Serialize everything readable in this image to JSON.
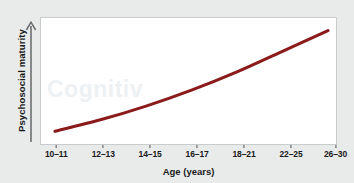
{
  "figure": {
    "background_color": "#e9ebeb",
    "plot_background_color": "#ffffff",
    "plot_border_color": "#c9cccd",
    "watermark_text": "Cognitiv"
  },
  "axes": {
    "y_arrow_icon": "up-arrow-icon",
    "y_axis_label": "Psychosocial maturity",
    "x_axis_label": "Age (years)"
  },
  "chart_data": {
    "type": "line",
    "title": "",
    "subtitle": "",
    "xlabel": "Age (years)",
    "ylabel": "Psychosocial maturity",
    "categories": [
      "10–11",
      "12–13",
      "14–15",
      "16–17",
      "18–21",
      "22–25",
      "26–30"
    ],
    "x": [
      0,
      1,
      2,
      3,
      4,
      5,
      6
    ],
    "values": [
      12,
      22,
      34,
      48,
      64,
      82,
      100
    ],
    "series": [
      {
        "name": "Psychosocial maturity",
        "color": "#8B1A1A",
        "line_width": 3,
        "values": [
          12,
          22,
          34,
          48,
          64,
          82,
          100
        ]
      }
    ],
    "ylim": [
      0,
      112
    ],
    "xlim": [
      -0.45,
      6.3
    ],
    "y_ticks": [],
    "y_tick_labels": [],
    "grid": false,
    "legend": false,
    "legend_position": "none",
    "annotations": []
  },
  "colors": {
    "curve": "#8B1A1A",
    "curve_highlight": "#a83232",
    "text": "#1a1a1a",
    "axis": "#555555"
  }
}
